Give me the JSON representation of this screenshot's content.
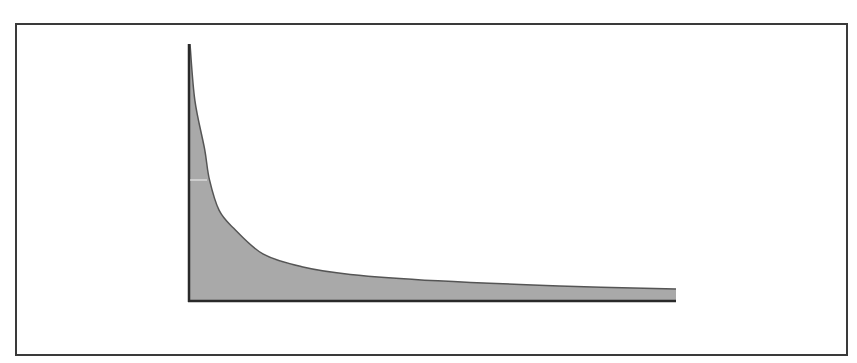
{
  "chart_data": {
    "type": "area",
    "title": "",
    "xlabel": "",
    "ylabel": "",
    "grid": false,
    "legend": null,
    "x": [
      0,
      0.01,
      0.03,
      0.04,
      0.06,
      0.09,
      0.15,
      0.23,
      0.33,
      0.51,
      0.76,
      1.0
    ],
    "values": [
      1.0,
      0.78,
      0.59,
      0.47,
      0.35,
      0.28,
      0.18,
      0.13,
      0.1,
      0.075,
      0.055,
      0.043
    ],
    "xlim": [
      0,
      1
    ],
    "ylim": [
      0,
      1
    ],
    "colors": {
      "fill": "#a9a9a9",
      "line": "#555555",
      "axis": "#2a2a2a",
      "frame": "#3a3a3a"
    }
  }
}
